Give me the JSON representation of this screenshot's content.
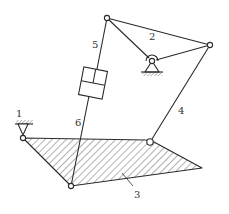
{
  "diagram": {
    "type": "linkage-mechanism",
    "colors": {
      "line": "#2a2a2a",
      "hatch": "#555555",
      "background": "#ffffff",
      "label": "#333333"
    },
    "labels": {
      "link1": "1",
      "link2": "2",
      "link3": "3",
      "link4": "4",
      "link5": "5",
      "link6": "6"
    },
    "joints": {
      "A": {
        "x": 107,
        "y": 18
      },
      "B": {
        "x": 210,
        "y": 45
      },
      "C_ground": {
        "x": 152,
        "y": 61
      },
      "O1_ground": {
        "x": 23,
        "y": 138
      },
      "D": {
        "x": 71,
        "y": 186
      },
      "E": {
        "x": 150,
        "y": 142
      },
      "plate_tip": {
        "x": 202,
        "y": 168
      }
    },
    "parts": [
      {
        "id": "link2",
        "desc": "ternary link A-B-C pivoted to ground at C"
      },
      {
        "id": "link3",
        "desc": "hatched triangular plate O1-E-tip-D"
      },
      {
        "id": "link4",
        "desc": "bar from B to E"
      },
      {
        "id": "link5-6",
        "desc": "hydraulic cylinder/slider between A and D"
      },
      {
        "id": "link1",
        "desc": "ground support at O1"
      }
    ]
  }
}
